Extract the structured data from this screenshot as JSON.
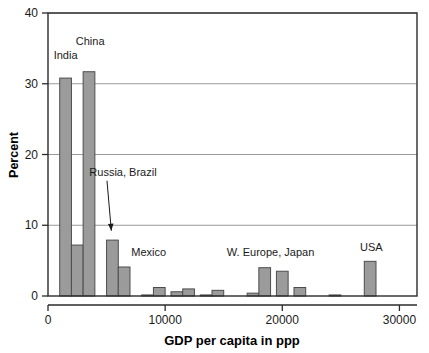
{
  "chart_data": {
    "type": "bar",
    "title": "",
    "subtitle": "",
    "xlabel": "GDP per capita in ppp",
    "ylabel": "Percent",
    "xlim": [
      0,
      31500
    ],
    "ylim": [
      0,
      40
    ],
    "grid": true,
    "legend": "none",
    "bar_color": "#9b9b9b",
    "bar_edge_color": "#4d4d4d",
    "bin_width": 1000,
    "x_ticks": [
      0,
      10000,
      20000,
      30000
    ],
    "x_tick_labels": [
      "0",
      "10000",
      "20000",
      "30000"
    ],
    "y_ticks": [
      0,
      10,
      20,
      30,
      40
    ],
    "y_tick_labels": [
      "0",
      "10",
      "20",
      "30",
      "40"
    ],
    "bins": [
      {
        "x0": 1000,
        "x1": 2000,
        "value": 30.8
      },
      {
        "x0": 2000,
        "x1": 3000,
        "value": 7.2
      },
      {
        "x0": 3000,
        "x1": 4000,
        "value": 31.7
      },
      {
        "x0": 5000,
        "x1": 6000,
        "value": 7.9
      },
      {
        "x0": 6000,
        "x1": 7000,
        "value": 4.1
      },
      {
        "x0": 8000,
        "x1": 9000,
        "value": 0.15
      },
      {
        "x0": 9000,
        "x1": 10000,
        "value": 1.2
      },
      {
        "x0": 10500,
        "x1": 11500,
        "value": 0.6
      },
      {
        "x0": 11500,
        "x1": 12500,
        "value": 1.0
      },
      {
        "x0": 13000,
        "x1": 14000,
        "value": 0.15
      },
      {
        "x0": 14000,
        "x1": 15000,
        "value": 0.8
      },
      {
        "x0": 17000,
        "x1": 18000,
        "value": 0.4
      },
      {
        "x0": 18000,
        "x1": 19000,
        "value": 4.0
      },
      {
        "x0": 19500,
        "x1": 20500,
        "value": 3.5
      },
      {
        "x0": 21000,
        "x1": 22000,
        "value": 1.2
      },
      {
        "x0": 24000,
        "x1": 25000,
        "value": 0.15
      },
      {
        "x0": 27000,
        "x1": 28000,
        "value": 4.9
      }
    ],
    "annotations": [
      {
        "name": "india",
        "text": "India",
        "x": 1500,
        "y": 33.5,
        "arrow": false
      },
      {
        "name": "china",
        "text": "China",
        "x": 3600,
        "y": 35.5,
        "arrow": false
      },
      {
        "name": "russia-brazil",
        "text": "Russia, Brazil",
        "x": 6400,
        "y": 17.0,
        "arrow": true,
        "arrow_to_x": 5150,
        "arrow_to_y": 8.8
      },
      {
        "name": "mexico",
        "text": "Mexico",
        "x": 8600,
        "y": 5.6,
        "arrow": false
      },
      {
        "name": "w-europe-japan",
        "text": "W. Europe, Japan",
        "x": 19000,
        "y": 5.6,
        "arrow": false
      },
      {
        "name": "usa",
        "text": "USA",
        "x": 27600,
        "y": 6.4,
        "arrow": false
      }
    ]
  }
}
